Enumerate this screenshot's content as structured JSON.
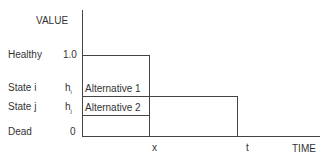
{
  "diagram": {
    "y_axis_label": "VALUE",
    "x_axis_label": "TIME",
    "row_labels": {
      "healthy": "Healthy",
      "state_i": "State i",
      "state_j": "State j",
      "dead": "Dead"
    },
    "y_ticks": {
      "healthy": "1.0",
      "state_i": "h",
      "state_i_sub": "i",
      "state_j": "h",
      "state_j_sub": "j",
      "dead": "0"
    },
    "x_ticks": {
      "x": "x",
      "t": "t"
    },
    "boxes": {
      "alt1": "Alternative 1",
      "alt2": "Alternative 2"
    }
  }
}
